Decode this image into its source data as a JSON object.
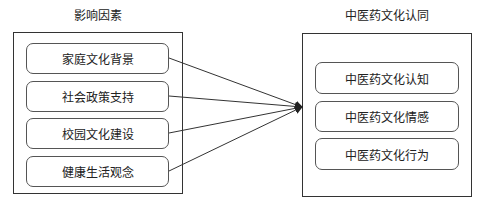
{
  "diagram": {
    "left_group": {
      "title": "影响因素",
      "items": [
        {
          "label": "家庭文化背景"
        },
        {
          "label": "社会政策支持"
        },
        {
          "label": "校园文化建设"
        },
        {
          "label": "健康生活观念"
        }
      ]
    },
    "right_group": {
      "title": "中医药文化认同",
      "items": [
        {
          "label": "中医药文化认知"
        },
        {
          "label": "中医药文化情感"
        },
        {
          "label": "中医药文化行为"
        }
      ]
    },
    "edges": [
      {
        "from": "家庭文化背景",
        "to": "中医药文化认同"
      },
      {
        "from": "社会政策支持",
        "to": "中医药文化认同"
      },
      {
        "from": "校园文化建设",
        "to": "中医药文化认同"
      },
      {
        "from": "健康生活观念",
        "to": "中医药文化认同"
      }
    ],
    "colors": {
      "line": "#333333",
      "background": "#ffffff"
    }
  }
}
